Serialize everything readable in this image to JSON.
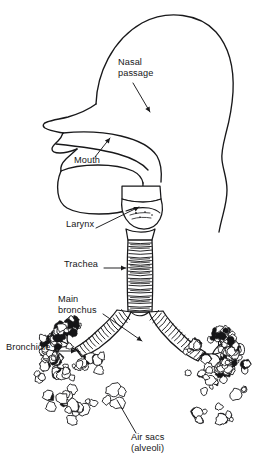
{
  "figure": {
    "style": "black and white line drawing",
    "background_color": "#ffffff",
    "ink_color": "#18181a"
  },
  "labels": [
    {
      "id": "nasal-passage",
      "text_line1": "Nasal",
      "text_line2": "passage",
      "x": 118,
      "y": 63,
      "pointer": "arrow",
      "target_x": 150,
      "target_y": 112
    },
    {
      "id": "mouth",
      "text_line1": "Mouth",
      "text_line2": "",
      "x": 74,
      "y": 160,
      "pointer": "arrow",
      "target_x": 108,
      "target_y": 139
    },
    {
      "id": "larynx",
      "text_line1": "Larynx",
      "text_line2": "",
      "x": 66,
      "y": 224,
      "pointer": "arrow",
      "target_x": 139,
      "target_y": 206
    },
    {
      "id": "trachea",
      "text_line1": "Trachea",
      "text_line2": "",
      "x": 64,
      "y": 264,
      "pointer": "arrow",
      "target_x": 127,
      "target_y": 268
    },
    {
      "id": "main-bronchus",
      "text_line1": "Main",
      "text_line2": "bronchus",
      "x": 58,
      "y": 299,
      "pointer": "arrow",
      "target_x": 140,
      "target_y": 340
    },
    {
      "id": "bronchiole",
      "text_line1": "Bronchiole",
      "text_line2": "",
      "x": 6,
      "y": 347,
      "pointer": "arrow",
      "target_x": 74,
      "target_y": 351
    },
    {
      "id": "air-sacs",
      "text_line1": "Air sacs",
      "text_line2": "(alveoli)",
      "x": 131,
      "y": 437,
      "pointer": "line",
      "target_x": 114,
      "target_y": 399
    }
  ],
  "structures": [
    {
      "id": "head-profile",
      "name": "Head profile outline"
    },
    {
      "id": "nasal-cavity",
      "name": "Nasal passage"
    },
    {
      "id": "mouth-cavity",
      "name": "Mouth cavity"
    },
    {
      "id": "tongue",
      "name": "Tongue"
    },
    {
      "id": "larynx",
      "name": "Larynx"
    },
    {
      "id": "trachea",
      "name": "Trachea",
      "cartilage_rings": 20
    },
    {
      "id": "bronchus-left",
      "name": "Left main bronchus"
    },
    {
      "id": "bronchus-right",
      "name": "Right main bronchus"
    },
    {
      "id": "lung-left",
      "name": "Left lung alveolar cluster"
    },
    {
      "id": "lung-right",
      "name": "Right lung alveolar cluster"
    }
  ]
}
